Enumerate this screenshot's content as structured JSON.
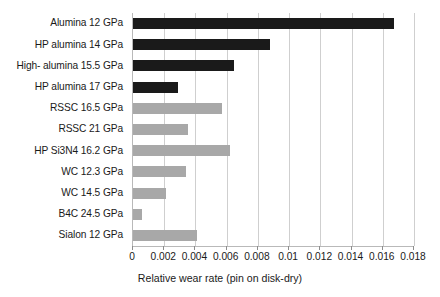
{
  "chart_data": {
    "type": "bar",
    "orientation": "horizontal",
    "title": "",
    "xlabel": "Relative wear rate (pin on disk-dry)",
    "ylabel": "",
    "xlim": [
      0,
      0.018
    ],
    "xticks": [
      0,
      0.002,
      0.004,
      0.006,
      0.008,
      0.01,
      0.012,
      0.014,
      0.016,
      0.018
    ],
    "xticklabels": [
      "0",
      "0.002",
      "0.004",
      "0.006",
      "0.008",
      "0.01",
      "0.012",
      "0.014",
      "0.016",
      "0.018"
    ],
    "grid": "vertical",
    "legend": "none",
    "categories": [
      "Alumina 12 GPa",
      "HP alumina 14 GPa",
      "High- alumina 15.5 GPa",
      "HP alumina 17 GPa",
      "RSSC 16.5 GPa",
      "RSSC 21 GPa",
      "HP Si3N4 16.2 GPa",
      "WC 12.3 GPa",
      "WC 14.5 GPa",
      "B4C 24.5 GPa",
      "Sialon 12 GPa"
    ],
    "values": [
      0.0167,
      0.0088,
      0.0065,
      0.0029,
      0.0057,
      0.0035,
      0.0062,
      0.0034,
      0.0021,
      0.0006,
      0.0041
    ],
    "bar_colors": [
      "#1a1a1a",
      "#1a1a1a",
      "#1a1a1a",
      "#1a1a1a",
      "#a8a8a8",
      "#a8a8a8",
      "#a8a8a8",
      "#a8a8a8",
      "#a8a8a8",
      "#a8a8a8",
      "#a8a8a8"
    ],
    "colors": {
      "dark_bar": "#1a1a1a",
      "light_bar": "#a8a8a8",
      "gridline": "#cfcfcf",
      "axis": "#b9b9b9",
      "background": "#ffffff",
      "text": "#1a1a1a"
    }
  }
}
